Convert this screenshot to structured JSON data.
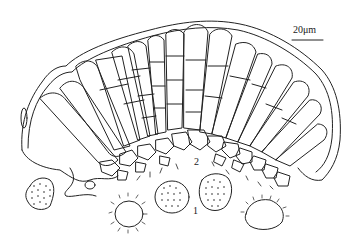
{
  "figure": {
    "scale_bar": {
      "label": "20μm"
    },
    "labels": [
      {
        "id": "spores",
        "text": "1"
      },
      {
        "id": "hymenium",
        "text": "2"
      }
    ],
    "line_color": "#222222",
    "background": "#ffffff"
  }
}
